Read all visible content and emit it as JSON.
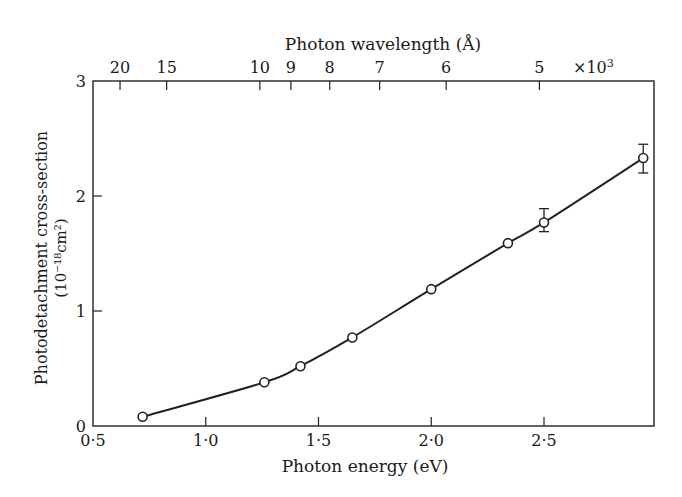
{
  "chart_data": {
    "type": "line",
    "title": "",
    "xlabel": "Photon energy (eV)",
    "ylabel": "Photodetachment cross-section",
    "ylabel_units": "(10⁻¹⁸cm²)",
    "top_xlabel": "Photon wavelength (Å)",
    "xlim": [
      0.5,
      2.97
    ],
    "ylim": [
      0,
      3
    ],
    "x_ticks": [
      0.5,
      1.0,
      1.5,
      2.0,
      2.5
    ],
    "x_tick_labels": [
      "0·5",
      "1·0",
      "1·5",
      "2·0",
      "2·5"
    ],
    "y_ticks": [
      0,
      1,
      2,
      3
    ],
    "y_tick_labels": [
      "0",
      "1",
      "2",
      "3"
    ],
    "top_ticks_wavelength_kA": [
      20,
      15,
      10,
      9,
      8,
      7,
      6,
      5
    ],
    "top_tick_labels": [
      "20",
      "15",
      "10",
      "9",
      "8",
      "7",
      "6",
      "5"
    ],
    "top_multiplier_label": "×10",
    "top_multiplier_exp": "3",
    "grid": false,
    "legend": null,
    "series": [
      {
        "name": "Photodetachment cross-section",
        "marker": "open-circle",
        "x": [
          0.72,
          1.26,
          1.42,
          1.65,
          2.0,
          2.34,
          2.5,
          2.94
        ],
        "y": [
          0.08,
          0.38,
          0.52,
          0.77,
          1.19,
          1.59,
          1.77,
          2.33
        ],
        "error_low": [
          null,
          null,
          null,
          null,
          null,
          null,
          1.69,
          2.2
        ],
        "error_high": [
          null,
          null,
          null,
          null,
          null,
          null,
          1.89,
          2.45
        ]
      }
    ]
  }
}
